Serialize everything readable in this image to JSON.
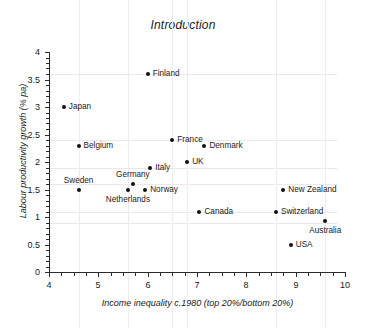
{
  "chart_data": {
    "type": "scatter",
    "title": "Introduction",
    "xlabel": "Income inequality c.1980 (top 20%/bottom 20%)",
    "ylabel": "Labour productivity growth (% pa)",
    "xlim": [
      4,
      10
    ],
    "ylim": [
      0,
      4
    ],
    "x_ticks": [
      "4",
      "5",
      "6",
      "7",
      "8",
      "9",
      "10"
    ],
    "y_ticks": [
      "0",
      "0.5",
      "1",
      "1.5",
      "2",
      "2.5",
      "3",
      "3.5",
      "4"
    ],
    "grid": false,
    "legend": "none",
    "points": [
      {
        "label": "Japan",
        "x": 4.3,
        "y": 3.0,
        "label_pos": "right"
      },
      {
        "label": "Belgium",
        "x": 4.6,
        "y": 2.3,
        "label_pos": "right"
      },
      {
        "label": "Sweden",
        "x": 4.6,
        "y": 1.5,
        "label_pos": "above"
      },
      {
        "label": "Netherlands",
        "x": 5.6,
        "y": 1.5,
        "label_pos": "below"
      },
      {
        "label": "Germany",
        "x": 5.7,
        "y": 1.6,
        "label_pos": "above"
      },
      {
        "label": "Norway",
        "x": 5.95,
        "y": 1.5,
        "label_pos": "right"
      },
      {
        "label": "Finland",
        "x": 6.0,
        "y": 3.6,
        "label_pos": "right"
      },
      {
        "label": "Italy",
        "x": 6.05,
        "y": 1.9,
        "label_pos": "right"
      },
      {
        "label": "France",
        "x": 6.5,
        "y": 2.4,
        "label_pos": "right"
      },
      {
        "label": "UK",
        "x": 6.8,
        "y": 2.0,
        "label_pos": "right"
      },
      {
        "label": "Canada",
        "x": 7.05,
        "y": 1.1,
        "label_pos": "right"
      },
      {
        "label": "Denmark",
        "x": 7.15,
        "y": 2.3,
        "label_pos": "right"
      },
      {
        "label": "Switzerland",
        "x": 8.6,
        "y": 1.1,
        "label_pos": "right"
      },
      {
        "label": "New Zealand",
        "x": 8.75,
        "y": 1.5,
        "label_pos": "right"
      },
      {
        "label": "USA",
        "x": 8.9,
        "y": 0.5,
        "label_pos": "right"
      },
      {
        "label": "Australia",
        "x": 9.6,
        "y": 0.92,
        "label_pos": "below"
      }
    ]
  }
}
